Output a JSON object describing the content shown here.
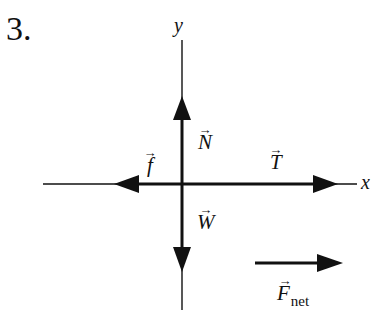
{
  "problem": {
    "number_label": "3."
  },
  "axes": {
    "x_label": "x",
    "y_label": "y",
    "origin": [
      182,
      184
    ],
    "x_range_px": [
      43,
      357
    ],
    "y_range_px": [
      40,
      310
    ]
  },
  "forces": [
    {
      "id": "normal",
      "symbol": "N",
      "subscript": "",
      "direction": "up",
      "arrow_glyph": "→"
    },
    {
      "id": "friction",
      "symbol": "f",
      "subscript": "",
      "direction": "left",
      "arrow_glyph": "→"
    },
    {
      "id": "tension",
      "symbol": "T",
      "subscript": "",
      "direction": "right",
      "arrow_glyph": "→"
    },
    {
      "id": "weight",
      "symbol": "W",
      "subscript": "",
      "direction": "down",
      "arrow_glyph": "→"
    }
  ],
  "net_force": {
    "symbol": "F",
    "subscript": "net",
    "direction": "right",
    "arrow_glyph": "→"
  },
  "colors": {
    "ink": "#111111",
    "background": "#ffffff"
  }
}
